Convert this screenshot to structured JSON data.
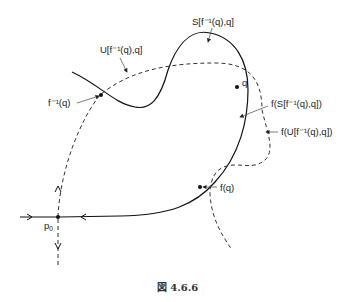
{
  "figure": {
    "caption": "図 4.6.6",
    "labels": {
      "S_segment": "S[f⁻¹(q),q]",
      "U_segment": "U[f⁻¹(q),q]",
      "f_inv_q": "f⁻¹(q)",
      "q": "q",
      "f_of_S": "f(S[f⁻¹(q),q])",
      "f_of_U": "f(U[f⁻¹(q),q])",
      "f_q": "f(q)",
      "p0": "p",
      "p0_sub": "0"
    },
    "curves": {
      "stable_manifold": "solid",
      "unstable_manifold": "dashed"
    }
  }
}
